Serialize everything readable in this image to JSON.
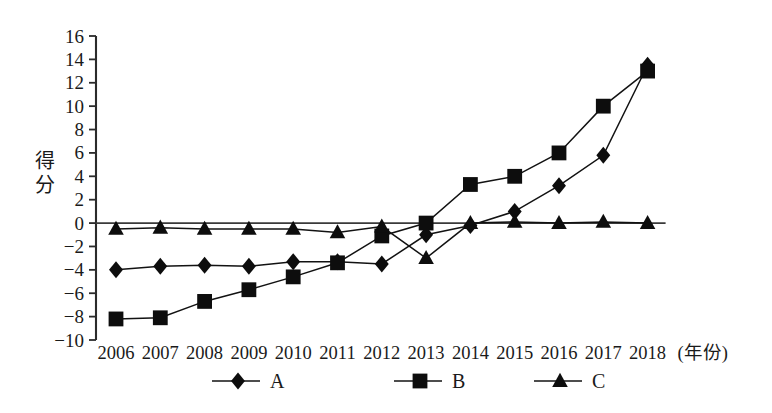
{
  "chart_data": {
    "type": "line",
    "title": "",
    "subtitle": "",
    "xlabel": "(年份)",
    "ylabel": "得分",
    "categories": [
      "2006",
      "2007",
      "2008",
      "2009",
      "2010",
      "2011",
      "2012",
      "2013",
      "2014",
      "2015",
      "2016",
      "2017",
      "2018"
    ],
    "x": [
      2006,
      2007,
      2008,
      2009,
      2010,
      2011,
      2012,
      2013,
      2014,
      2015,
      2016,
      2017,
      2018
    ],
    "series": [
      {
        "name": "A",
        "marker": "diamond",
        "values": [
          -4.0,
          -3.7,
          -3.6,
          -3.7,
          -3.3,
          -3.3,
          -3.5,
          -1.0,
          -0.2,
          1.0,
          3.2,
          5.8,
          13.5
        ]
      },
      {
        "name": "B",
        "marker": "square",
        "values": [
          -8.2,
          -8.1,
          -6.7,
          -5.7,
          -4.6,
          -3.4,
          -1.1,
          0.0,
          3.3,
          4.0,
          6.0,
          10.0,
          13.0
        ]
      },
      {
        "name": "C",
        "marker": "triangle",
        "values": [
          -0.5,
          -0.4,
          -0.5,
          -0.5,
          -0.5,
          -0.8,
          -0.3,
          -3.0,
          0.0,
          0.1,
          0.0,
          0.1,
          0.0
        ]
      }
    ],
    "ylim": [
      -10,
      16
    ],
    "ytick_values": [
      16,
      14,
      12,
      10,
      8,
      6,
      4,
      2,
      0,
      -2,
      -4,
      -6,
      -8,
      -10
    ],
    "ytick_labels": [
      "16",
      "14",
      "12",
      "10",
      "8",
      "6",
      "4",
      "2",
      "0",
      "−2",
      "−4",
      "−6",
      "−8",
      "−10"
    ],
    "grid": false,
    "legend_position": "bottom",
    "legend": [
      "A",
      "B",
      "C"
    ],
    "colors": {
      "axis": "#2b2b2b",
      "series": "#121212",
      "background": "#ffffff"
    }
  },
  "ylabel_chars": [
    "得",
    "分"
  ]
}
